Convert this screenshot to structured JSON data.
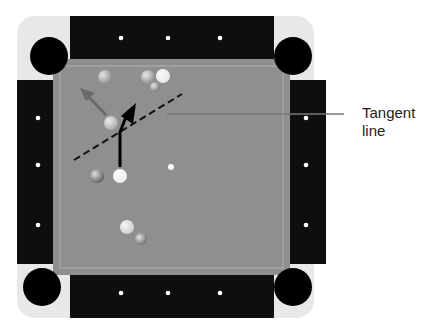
{
  "figure": {
    "annotation": {
      "line1": "Tangent",
      "line2": "line"
    },
    "colors": {
      "rail": "#111111",
      "corner": "#e8e8e8",
      "felt": "#8f8f8f",
      "cushion": "#9d9d9d",
      "pocket": "#000000",
      "diamond": "#ffffff",
      "arrow_cue": "#000000",
      "arrow_object": "#6a6a6a",
      "tangent": "#111111",
      "leader": "#777777"
    },
    "diamonds": {
      "top": [
        [
          121,
          38
        ],
        [
          168,
          38
        ],
        [
          220,
          38
        ]
      ],
      "left": [
        [
          38,
          118
        ],
        [
          38,
          165
        ],
        [
          38,
          225
        ]
      ],
      "right": [
        [
          306,
          118
        ],
        [
          306,
          165
        ],
        [
          306,
          225
        ]
      ],
      "bottom": [
        [
          121,
          293
        ],
        [
          168,
          293
        ],
        [
          220,
          293
        ]
      ]
    },
    "balls": [
      {
        "name": "ball-top-left",
        "x": 105,
        "y": 77,
        "r": 7,
        "fill": "#8a8a8a"
      },
      {
        "name": "ball-cluster-1",
        "x": 148,
        "y": 77,
        "r": 7,
        "fill": "#8c8c8c"
      },
      {
        "name": "ball-cue-top",
        "x": 163,
        "y": 76,
        "r": 7,
        "fill": "#e6e6e6"
      },
      {
        "name": "ball-cluster-2",
        "x": 155,
        "y": 87,
        "r": 5,
        "fill": "#7a7a7a"
      },
      {
        "name": "object-ball",
        "x": 111,
        "y": 123,
        "r": 7,
        "fill": "#a5a5a5"
      },
      {
        "name": "ball-dark-left",
        "x": 97,
        "y": 176,
        "r": 7,
        "fill": "#5e5e5e"
      },
      {
        "name": "cue-ball",
        "x": 120,
        "y": 176,
        "r": 7,
        "fill": "#ededed"
      },
      {
        "name": "spot",
        "x": 171,
        "y": 167,
        "r": 3,
        "fill": "#f5f5f5"
      },
      {
        "name": "ball-bottom-light",
        "x": 127,
        "y": 227,
        "r": 7,
        "fill": "#cfcfcf"
      },
      {
        "name": "ball-bottom-dark",
        "x": 141,
        "y": 239,
        "r": 6,
        "fill": "#6e6e6e"
      }
    ]
  }
}
